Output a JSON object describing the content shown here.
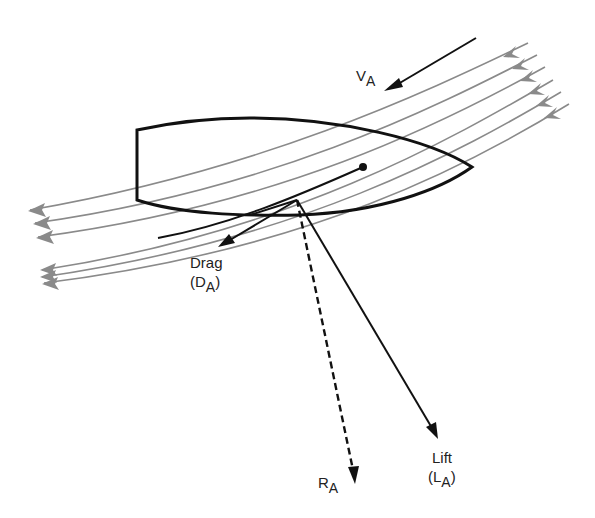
{
  "diagram": {
    "labels": {
      "apparent_wind": {
        "main": "V",
        "sub": "A"
      },
      "drag_line1": "Drag",
      "drag_line2": {
        "open": "(D",
        "sub": "A",
        "close": ")"
      },
      "resultant": {
        "main": "R",
        "sub": "A"
      },
      "lift_line1": "Lift",
      "lift_line2": {
        "open": "(L",
        "sub": "A",
        "close": ")"
      }
    },
    "colors": {
      "streamline": "#8a8a8a",
      "line": "#111111",
      "background": "#ffffff"
    },
    "streamline_count": 6,
    "vectors": [
      "apparent wind V_A",
      "drag D_A",
      "lift L_A",
      "resultant R_A (dashed)"
    ]
  }
}
